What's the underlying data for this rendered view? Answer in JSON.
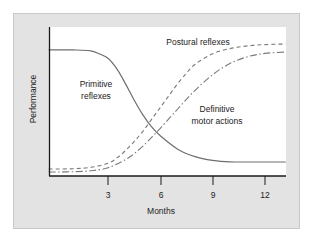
{
  "chart_data": {
    "type": "line",
    "title": "",
    "xlabel": "Months",
    "ylabel": "Performance",
    "x_ticks": [
      3,
      6,
      9,
      12
    ],
    "x_tick_labels": [
      "3",
      "6",
      "9",
      "12"
    ],
    "xlim": [
      -0.4,
      13.2
    ],
    "ylim": [
      0,
      100
    ],
    "y_ticks": [],
    "grid": false,
    "legend": "inline labels",
    "series": [
      {
        "name": "Primitive reflexes",
        "style": "solid",
        "x": [
          -0.4,
          0,
          1,
          2,
          2.5,
          3,
          3.5,
          4,
          4.5,
          5,
          5.5,
          6,
          7,
          8,
          9,
          10,
          11,
          12,
          13.2
        ],
        "y": [
          84.6,
          84.6,
          84.6,
          84,
          82,
          79,
          72,
          62,
          51,
          41,
          33,
          27,
          18,
          13,
          10.5,
          9.5,
          9.4,
          9.4,
          9.4
        ]
      },
      {
        "name": "Postural reflexes",
        "style": "dashed",
        "x": [
          -0.4,
          0,
          1,
          2,
          3,
          3.5,
          4,
          4.5,
          5,
          5.5,
          6,
          6.5,
          7,
          7.5,
          8,
          9,
          10,
          11,
          12,
          13.2
        ],
        "y": [
          4.7,
          4.7,
          4.9,
          5.8,
          8.5,
          12,
          17,
          23,
          30,
          38,
          46,
          54,
          62,
          69,
          75,
          82,
          85.5,
          87.3,
          88.2,
          88.6
        ]
      },
      {
        "name": "Definitive motor actions",
        "style": "dash-dot",
        "x": [
          -0.4,
          0,
          1,
          2,
          3,
          4,
          4.5,
          5,
          5.5,
          6,
          6.5,
          7,
          7.5,
          8,
          9,
          10,
          11,
          12,
          13.2
        ],
        "y": [
          2.7,
          2.7,
          2.9,
          3.5,
          5.5,
          11,
          15,
          20,
          26,
          32,
          38.5,
          45,
          51.5,
          57.5,
          68,
          75.5,
          80,
          82.3,
          83.2
        ]
      }
    ],
    "annotations": [
      {
        "text": [
          "Postural reflexes"
        ],
        "x": 8.5,
        "y": 90
      },
      {
        "text": [
          "Primitive",
          "reflexes"
        ],
        "x": 2.3,
        "y": 58
      },
      {
        "text": [
          "Definitive",
          "motor actions"
        ],
        "x": 9.25,
        "y": 40
      }
    ]
  },
  "labels": {
    "xlabel": "Months",
    "ylabel": "Performance",
    "postural": "Postural reflexes",
    "primitive_1": "Primitive",
    "primitive_2": "reflexes",
    "definitive_1": "Definitive",
    "definitive_2": "motor actions",
    "tick_3": "3",
    "tick_6": "6",
    "tick_9": "9",
    "tick_12": "12"
  },
  "colors": {
    "panel": "#e3e3e3",
    "plot": "#ffffff",
    "axis": "#1a1a1a",
    "curve": "#6e6e6e"
  }
}
